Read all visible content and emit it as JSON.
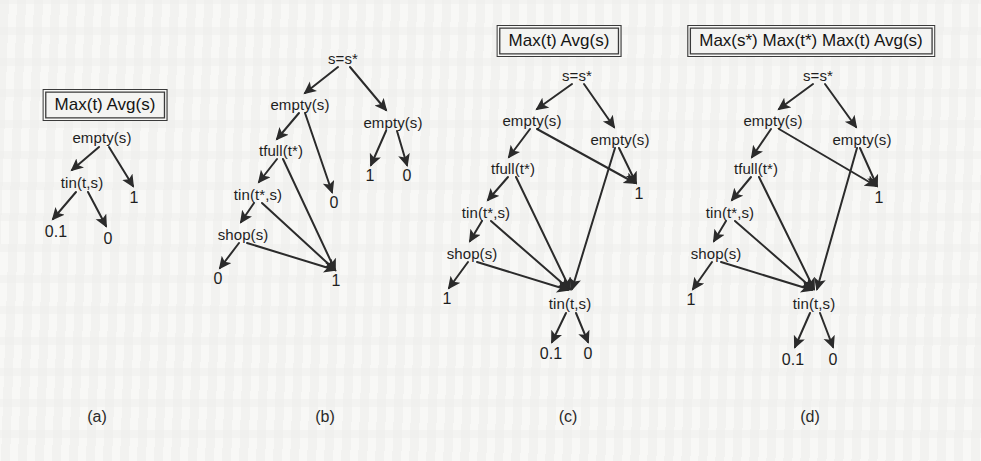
{
  "figure": {
    "width": 981,
    "height": 461,
    "background_color": "#f8f8f6",
    "ink_color": "#1e1e1e"
  },
  "panels": [
    {
      "id": "a",
      "caption": "(a)",
      "caption_pos": [
        97,
        417
      ],
      "title": "Max(t) Avg(s)",
      "title_pos": [
        105,
        105
      ],
      "nodes": [
        {
          "name": "empty-s",
          "label": "empty(s)",
          "x": 102,
          "y": 137,
          "kind": "internal"
        },
        {
          "name": "tin-t-s",
          "label": "tin(t,s)",
          "x": 82,
          "y": 182,
          "kind": "internal"
        },
        {
          "name": "one",
          "label": "1",
          "x": 134,
          "y": 198,
          "kind": "leaf"
        },
        {
          "name": "zero-one",
          "label": "0.1",
          "x": 56,
          "y": 232,
          "kind": "leaf"
        },
        {
          "name": "zero",
          "label": "0",
          "x": 108,
          "y": 239,
          "kind": "leaf"
        }
      ],
      "edges": [
        {
          "from": "empty-s",
          "to": "tin-t-s",
          "x1": 99,
          "y1": 147,
          "x2": 72,
          "y2": 170
        },
        {
          "from": "empty-s",
          "to": "one",
          "x1": 109,
          "y1": 147,
          "x2": 133,
          "y2": 186
        },
        {
          "from": "tin-t-s",
          "to": "zero-one",
          "x1": 76,
          "y1": 192,
          "x2": 53,
          "y2": 219
        },
        {
          "from": "tin-t-s",
          "to": "zero",
          "x1": 88,
          "y1": 192,
          "x2": 106,
          "y2": 226
        }
      ]
    },
    {
      "id": "b",
      "caption": "(b)",
      "caption_pos": [
        325,
        417
      ],
      "title": null,
      "title_pos": null,
      "nodes": [
        {
          "name": "s-eq-sstar",
          "label": "s=s*",
          "x": 343,
          "y": 58,
          "kind": "internal"
        },
        {
          "name": "empty-s-left",
          "label": "empty(s)",
          "x": 300,
          "y": 104,
          "kind": "internal"
        },
        {
          "name": "empty-s-right",
          "label": "empty(s)",
          "x": 393,
          "y": 122,
          "kind": "internal"
        },
        {
          "name": "tfull-tstar",
          "label": "tfull(t*)",
          "x": 281,
          "y": 150,
          "kind": "internal"
        },
        {
          "name": "tin-tstar-s",
          "label": "tin(t*,s)",
          "x": 258,
          "y": 194,
          "kind": "internal"
        },
        {
          "name": "shop-s",
          "label": "shop(s)",
          "x": 243,
          "y": 234,
          "kind": "internal"
        },
        {
          "name": "zero-mid",
          "label": "0",
          "x": 334,
          "y": 203,
          "kind": "leaf"
        },
        {
          "name": "one-right",
          "label": "1",
          "x": 370,
          "y": 176,
          "kind": "leaf"
        },
        {
          "name": "zero-right",
          "label": "0",
          "x": 407,
          "y": 176,
          "kind": "leaf"
        },
        {
          "name": "zero-bottom",
          "label": "0",
          "x": 218,
          "y": 279,
          "kind": "leaf"
        },
        {
          "name": "one-bottom",
          "label": "1",
          "x": 336,
          "y": 281,
          "kind": "leaf"
        }
      ],
      "edges": [
        {
          "from": "s-eq-sstar",
          "to": "empty-s-left",
          "x1": 338,
          "y1": 67,
          "x2": 305,
          "y2": 93
        },
        {
          "from": "s-eq-sstar",
          "to": "empty-s-right",
          "x1": 350,
          "y1": 67,
          "x2": 386,
          "y2": 110
        },
        {
          "from": "empty-s-left",
          "to": "tfull-tstar",
          "x1": 299,
          "y1": 113,
          "x2": 277,
          "y2": 139
        },
        {
          "from": "empty-s-left",
          "to": "zero-mid",
          "x1": 305,
          "y1": 113,
          "x2": 332,
          "y2": 192
        },
        {
          "from": "empty-s-right",
          "to": "one-right",
          "x1": 386,
          "y1": 131,
          "x2": 371,
          "y2": 165
        },
        {
          "from": "empty-s-right",
          "to": "zero-right",
          "x1": 397,
          "y1": 131,
          "x2": 407,
          "y2": 165
        },
        {
          "from": "tfull-tstar",
          "to": "tin-tstar-s",
          "x1": 277,
          "y1": 159,
          "x2": 259,
          "y2": 182
        },
        {
          "from": "tfull-tstar",
          "to": "one-bottom",
          "x1": 283,
          "y1": 159,
          "x2": 335,
          "y2": 270
        },
        {
          "from": "tin-tstar-s",
          "to": "shop-s",
          "x1": 254,
          "y1": 203,
          "x2": 241,
          "y2": 222
        },
        {
          "from": "tin-tstar-s",
          "to": "one-bottom",
          "x1": 262,
          "y1": 203,
          "x2": 335,
          "y2": 270
        },
        {
          "from": "shop-s",
          "to": "zero-bottom",
          "x1": 239,
          "y1": 243,
          "x2": 220,
          "y2": 268
        },
        {
          "from": "shop-s",
          "to": "one-bottom",
          "x1": 247,
          "y1": 243,
          "x2": 335,
          "y2": 270
        }
      ]
    },
    {
      "id": "c",
      "caption": "(c)",
      "caption_pos": [
        568,
        417
      ],
      "title": "Max(t) Avg(s)",
      "title_pos": [
        559,
        41
      ],
      "nodes": [
        {
          "name": "s-eq-sstar",
          "label": "s=s*",
          "x": 577,
          "y": 75,
          "kind": "internal"
        },
        {
          "name": "empty-s-left",
          "label": "empty(s)",
          "x": 532,
          "y": 120,
          "kind": "internal"
        },
        {
          "name": "empty-s-right",
          "label": "empty(s)",
          "x": 620,
          "y": 139,
          "kind": "internal"
        },
        {
          "name": "tfull-tstar",
          "label": "tfull(t*)",
          "x": 513,
          "y": 168,
          "kind": "internal"
        },
        {
          "name": "tin-tstar-s",
          "label": "tin(t*,s)",
          "x": 486,
          "y": 212,
          "kind": "internal"
        },
        {
          "name": "shop-s",
          "label": "shop(s)",
          "x": 472,
          "y": 253,
          "kind": "internal"
        },
        {
          "name": "one-right",
          "label": "1",
          "x": 639,
          "y": 194,
          "kind": "leaf"
        },
        {
          "name": "one-bottom",
          "label": "1",
          "x": 447,
          "y": 299,
          "kind": "leaf"
        },
        {
          "name": "tin-t-s",
          "label": "tin(t,s)",
          "x": 570,
          "y": 303,
          "kind": "internal"
        },
        {
          "name": "zero-one",
          "label": "0.1",
          "x": 551,
          "y": 354,
          "kind": "leaf"
        },
        {
          "name": "zero",
          "label": "0",
          "x": 588,
          "y": 354,
          "kind": "leaf"
        }
      ],
      "edges": [
        {
          "from": "s-eq-sstar",
          "to": "empty-s-left",
          "x1": 572,
          "y1": 84,
          "x2": 537,
          "y2": 109
        },
        {
          "from": "s-eq-sstar",
          "to": "empty-s-right",
          "x1": 584,
          "y1": 84,
          "x2": 614,
          "y2": 127
        },
        {
          "from": "empty-s-left",
          "to": "tfull-tstar",
          "x1": 530,
          "y1": 129,
          "x2": 509,
          "y2": 157
        },
        {
          "from": "empty-s-left",
          "to": "one-right",
          "x1": 537,
          "y1": 129,
          "x2": 635,
          "y2": 183
        },
        {
          "from": "empty-s-right",
          "to": "one-right",
          "x1": 619,
          "y1": 148,
          "x2": 636,
          "y2": 183
        },
        {
          "from": "empty-s-right",
          "to": "tin-t-s",
          "x1": 615,
          "y1": 148,
          "x2": 572,
          "y2": 289
        },
        {
          "from": "tfull-tstar",
          "to": "tin-tstar-s",
          "x1": 508,
          "y1": 177,
          "x2": 488,
          "y2": 200
        },
        {
          "from": "tfull-tstar",
          "to": "tin-t-s",
          "x1": 516,
          "y1": 177,
          "x2": 570,
          "y2": 289
        },
        {
          "from": "tin-tstar-s",
          "to": "shop-s",
          "x1": 482,
          "y1": 221,
          "x2": 470,
          "y2": 241
        },
        {
          "from": "tin-tstar-s",
          "to": "tin-t-s",
          "x1": 491,
          "y1": 221,
          "x2": 569,
          "y2": 289
        },
        {
          "from": "shop-s",
          "to": "one-bottom",
          "x1": 468,
          "y1": 262,
          "x2": 449,
          "y2": 288
        },
        {
          "from": "shop-s",
          "to": "tin-t-s",
          "x1": 477,
          "y1": 262,
          "x2": 568,
          "y2": 290
        },
        {
          "from": "tin-t-s",
          "to": "zero-one",
          "x1": 566,
          "y1": 313,
          "x2": 552,
          "y2": 342
        },
        {
          "from": "tin-t-s",
          "to": "zero",
          "x1": 576,
          "y1": 313,
          "x2": 588,
          "y2": 342
        }
      ]
    },
    {
      "id": "d",
      "caption": "(d)",
      "caption_pos": [
        810,
        417
      ],
      "title": "Max(s*) Max(t*) Max(t) Avg(s)",
      "title_pos": [
        811,
        41
      ],
      "nodes": [
        {
          "name": "s-eq-sstar",
          "label": "s=s*",
          "x": 818,
          "y": 75,
          "kind": "internal"
        },
        {
          "name": "empty-s-left",
          "label": "empty(s)",
          "x": 773,
          "y": 120,
          "kind": "internal"
        },
        {
          "name": "empty-s-right",
          "label": "empty(s)",
          "x": 862,
          "y": 139,
          "kind": "internal"
        },
        {
          "name": "tfull-tstar",
          "label": "tfull(t*)",
          "x": 756,
          "y": 168,
          "kind": "internal"
        },
        {
          "name": "tin-tstar-s",
          "label": "tin(t*,s)",
          "x": 730,
          "y": 212,
          "kind": "internal"
        },
        {
          "name": "shop-s",
          "label": "shop(s)",
          "x": 716,
          "y": 253,
          "kind": "internal"
        },
        {
          "name": "one-right",
          "label": "1",
          "x": 879,
          "y": 198,
          "kind": "leaf"
        },
        {
          "name": "one-bottom",
          "label": "1",
          "x": 691,
          "y": 300,
          "kind": "leaf"
        },
        {
          "name": "tin-t-s",
          "label": "tin(t,s)",
          "x": 814,
          "y": 303,
          "kind": "internal"
        },
        {
          "name": "zero-one",
          "label": "0.1",
          "x": 793,
          "y": 360,
          "kind": "leaf"
        },
        {
          "name": "zero",
          "label": "0",
          "x": 833,
          "y": 360,
          "kind": "leaf"
        }
      ],
      "edges": [
        {
          "from": "s-eq-sstar",
          "to": "empty-s-left",
          "x1": 813,
          "y1": 84,
          "x2": 779,
          "y2": 109
        },
        {
          "from": "s-eq-sstar",
          "to": "empty-s-right",
          "x1": 825,
          "y1": 84,
          "x2": 856,
          "y2": 127
        },
        {
          "from": "empty-s-left",
          "to": "tfull-tstar",
          "x1": 771,
          "y1": 129,
          "x2": 752,
          "y2": 157
        },
        {
          "from": "empty-s-left",
          "to": "one-right",
          "x1": 779,
          "y1": 129,
          "x2": 876,
          "y2": 186
        },
        {
          "from": "empty-s-right",
          "to": "one-right",
          "x1": 860,
          "y1": 148,
          "x2": 877,
          "y2": 186
        },
        {
          "from": "empty-s-right",
          "to": "tin-t-s",
          "x1": 857,
          "y1": 148,
          "x2": 817,
          "y2": 289
        },
        {
          "from": "tfull-tstar",
          "to": "tin-tstar-s",
          "x1": 751,
          "y1": 177,
          "x2": 732,
          "y2": 200
        },
        {
          "from": "tfull-tstar",
          "to": "tin-t-s",
          "x1": 759,
          "y1": 177,
          "x2": 814,
          "y2": 289
        },
        {
          "from": "tin-tstar-s",
          "to": "shop-s",
          "x1": 726,
          "y1": 221,
          "x2": 714,
          "y2": 241
        },
        {
          "from": "tin-tstar-s",
          "to": "tin-t-s",
          "x1": 735,
          "y1": 221,
          "x2": 813,
          "y2": 289
        },
        {
          "from": "shop-s",
          "to": "one-bottom",
          "x1": 712,
          "y1": 262,
          "x2": 693,
          "y2": 289
        },
        {
          "from": "shop-s",
          "to": "tin-t-s",
          "x1": 721,
          "y1": 262,
          "x2": 812,
          "y2": 290
        },
        {
          "from": "tin-t-s",
          "to": "zero-one",
          "x1": 810,
          "y1": 313,
          "x2": 795,
          "y2": 347
        },
        {
          "from": "tin-t-s",
          "to": "zero",
          "x1": 820,
          "y1": 313,
          "x2": 833,
          "y2": 347
        }
      ]
    }
  ]
}
